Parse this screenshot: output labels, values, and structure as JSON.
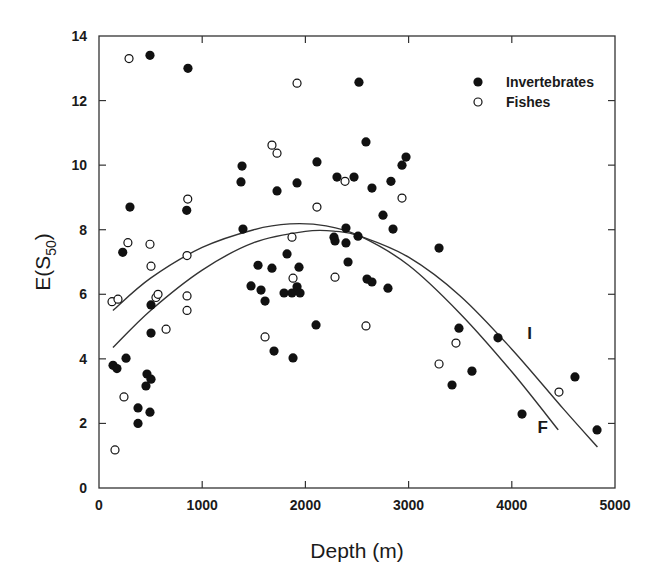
{
  "chart_data": {
    "type": "scatter",
    "title": "",
    "xlabel": "Depth (m)",
    "ylabel_main": "E(S",
    "ylabel_sub": "50",
    "ylabel_close": ")",
    "xlim": [
      0,
      5000
    ],
    "ylim": [
      0,
      14
    ],
    "x_ticks": [
      0,
      1000,
      2000,
      3000,
      4000,
      5000
    ],
    "y_ticks": [
      0,
      2,
      4,
      6,
      8,
      10,
      12,
      14
    ],
    "grid": false,
    "legend_position": "upper right",
    "legend": [
      {
        "name": "Invertebrates",
        "marker": "filled-circle"
      },
      {
        "name": "Fishes",
        "marker": "open-circle"
      }
    ],
    "series": [
      {
        "name": "Invertebrates",
        "marker": "filled-circle",
        "points": [
          [
            494,
            13.4
          ],
          [
            862,
            13.0
          ],
          [
            300,
            8.7
          ],
          [
            850,
            8.6
          ],
          [
            230,
            7.3
          ],
          [
            504,
            5.67
          ],
          [
            504,
            4.8
          ],
          [
            262,
            4.02
          ],
          [
            136,
            3.8
          ],
          [
            174,
            3.7
          ],
          [
            465,
            3.53
          ],
          [
            504,
            3.37
          ],
          [
            455,
            3.16
          ],
          [
            378,
            2.48
          ],
          [
            494,
            2.35
          ],
          [
            378,
            2.0
          ],
          [
            2519,
            12.57
          ],
          [
            2587,
            10.72
          ],
          [
            1386,
            9.97
          ],
          [
            1376,
            9.48
          ],
          [
            2112,
            10.1
          ],
          [
            2975,
            10.25
          ],
          [
            2936,
            10.0
          ],
          [
            1725,
            9.2
          ],
          [
            1919,
            9.45
          ],
          [
            2306,
            9.63
          ],
          [
            2471,
            9.63
          ],
          [
            2645,
            9.29
          ],
          [
            2829,
            9.5
          ],
          [
            2752,
            8.45
          ],
          [
            1395,
            8.02
          ],
          [
            2393,
            8.05
          ],
          [
            2849,
            8.02
          ],
          [
            2277,
            7.77
          ],
          [
            2287,
            7.65
          ],
          [
            2393,
            7.59
          ],
          [
            2510,
            7.8
          ],
          [
            1822,
            7.25
          ],
          [
            1541,
            6.9
          ],
          [
            1676,
            6.81
          ],
          [
            1938,
            6.84
          ],
          [
            2413,
            7.0
          ],
          [
            2597,
            6.47
          ],
          [
            2645,
            6.38
          ],
          [
            2800,
            6.19
          ],
          [
            1473,
            6.26
          ],
          [
            1570,
            6.13
          ],
          [
            1609,
            5.79
          ],
          [
            1793,
            6.04
          ],
          [
            1870,
            6.04
          ],
          [
            1919,
            6.23
          ],
          [
            1948,
            6.04
          ],
          [
            2103,
            5.05
          ],
          [
            1696,
            4.24
          ],
          [
            1880,
            4.03
          ],
          [
            3295,
            7.43
          ],
          [
            3488,
            4.95
          ],
          [
            3866,
            4.65
          ],
          [
            3614,
            3.62
          ],
          [
            3421,
            3.19
          ],
          [
            4612,
            3.44
          ],
          [
            4099,
            2.29
          ],
          [
            4826,
            1.8
          ]
        ]
      },
      {
        "name": "Fishes",
        "marker": "open-circle",
        "points": [
          [
            291,
            13.3
          ],
          [
            860,
            8.95
          ],
          [
            280,
            7.6
          ],
          [
            494,
            7.55
          ],
          [
            504,
            6.87
          ],
          [
            853,
            7.2
          ],
          [
            126,
            5.77
          ],
          [
            184,
            5.85
          ],
          [
            552,
            5.9
          ],
          [
            572,
            6.0
          ],
          [
            853,
            5.95
          ],
          [
            853,
            5.5
          ],
          [
            650,
            4.92
          ],
          [
            242,
            2.82
          ],
          [
            155,
            1.18
          ],
          [
            1919,
            12.54
          ],
          [
            1676,
            10.62
          ],
          [
            1725,
            10.37
          ],
          [
            2384,
            9.5
          ],
          [
            2936,
            8.98
          ],
          [
            2112,
            8.7
          ],
          [
            1870,
            7.77
          ],
          [
            2287,
            6.53
          ],
          [
            1880,
            6.5
          ],
          [
            2587,
            5.02
          ],
          [
            1609,
            4.68
          ],
          [
            3459,
            4.49
          ],
          [
            3295,
            3.84
          ],
          [
            4457,
            2.97
          ]
        ]
      }
    ],
    "fitted_curves": [
      {
        "label": "F",
        "description": "Fishes quadratic fit",
        "points": [
          [
            135,
            5.5
          ],
          [
            500,
            6.5
          ],
          [
            1000,
            7.45
          ],
          [
            1500,
            8.0
          ],
          [
            1850,
            8.18
          ],
          [
            2200,
            8.12
          ],
          [
            2530,
            7.8
          ],
          [
            3000,
            6.9
          ],
          [
            3500,
            5.4
          ],
          [
            4000,
            3.6
          ],
          [
            4450,
            1.8
          ]
        ],
        "label_position": [
          4250,
          1.7
        ]
      },
      {
        "label": "I",
        "description": "Invertebrates quadratic fit",
        "points": [
          [
            135,
            4.35
          ],
          [
            500,
            5.5
          ],
          [
            1000,
            6.75
          ],
          [
            1500,
            7.6
          ],
          [
            2000,
            7.95
          ],
          [
            2300,
            7.95
          ],
          [
            2530,
            7.8
          ],
          [
            3000,
            7.15
          ],
          [
            3500,
            5.95
          ],
          [
            4000,
            4.3
          ],
          [
            4500,
            2.45
          ],
          [
            4830,
            1.27
          ]
        ],
        "label_position": [
          4150,
          4.6
        ]
      }
    ]
  }
}
